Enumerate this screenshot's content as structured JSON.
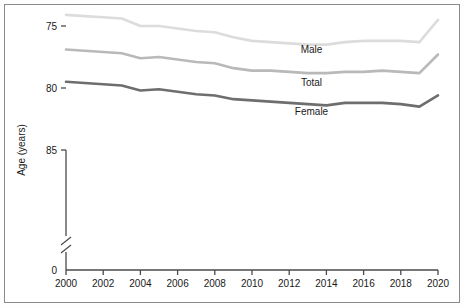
{
  "chart_data": {
    "type": "line",
    "title": "",
    "xlabel": "",
    "ylabel": "Age (years)",
    "x": [
      2000,
      2001,
      2002,
      2003,
      2004,
      2005,
      2006,
      2007,
      2008,
      2009,
      2010,
      2011,
      2012,
      2013,
      2014,
      2015,
      2016,
      2017,
      2018,
      2019,
      2020
    ],
    "xlim": [
      2000,
      2020
    ],
    "ylim": [
      69.5,
      85
    ],
    "y_axis_break": true,
    "y_break_below": 70,
    "grid": false,
    "legend_position": "inline-labels",
    "xtick_labels": [
      "2000",
      "2002",
      "2004",
      "2006",
      "2008",
      "2010",
      "2012",
      "2014",
      "2016",
      "2018",
      "2020"
    ],
    "ytick_labels": [
      "0",
      "70",
      "75",
      "80",
      "85"
    ],
    "ytick_values": [
      0,
      70,
      75,
      80,
      85
    ],
    "series": [
      {
        "name": "Female",
        "color": "#6e6e6e",
        "stroke_width": 2.6,
        "values": [
          79.5,
          79.6,
          79.7,
          79.8,
          80.2,
          80.1,
          80.3,
          80.5,
          80.6,
          80.9,
          81.0,
          81.1,
          81.2,
          81.3,
          81.4,
          81.2,
          81.2,
          81.2,
          81.3,
          81.5,
          80.6
        ]
      },
      {
        "name": "Total",
        "color": "#b9b9b9",
        "stroke_width": 2.6,
        "values": [
          76.9,
          77.0,
          77.1,
          77.2,
          77.6,
          77.5,
          77.7,
          77.9,
          78.0,
          78.4,
          78.6,
          78.6,
          78.7,
          78.8,
          78.8,
          78.7,
          78.7,
          78.6,
          78.7,
          78.8,
          77.3
        ]
      },
      {
        "name": "Male",
        "color": "#dcdcdc",
        "stroke_width": 2.6,
        "values": [
          74.1,
          74.2,
          74.3,
          74.4,
          75.0,
          75.0,
          75.2,
          75.4,
          75.5,
          75.9,
          76.2,
          76.3,
          76.4,
          76.5,
          76.5,
          76.3,
          76.2,
          76.2,
          76.2,
          76.3,
          74.5
        ]
      }
    ],
    "series_labels": [
      {
        "text": "Female",
        "x": 2013.2,
        "y": 82.2
      },
      {
        "text": "Total",
        "x": 2013.2,
        "y": 79.8
      },
      {
        "text": "Male",
        "x": 2013.2,
        "y": 77.2
      }
    ]
  }
}
